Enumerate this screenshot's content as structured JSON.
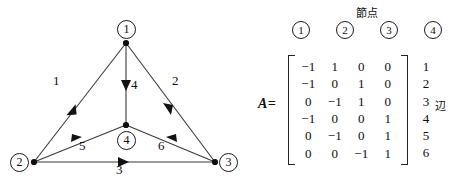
{
  "figure": {
    "graph": {
      "nodes": [
        {
          "id": "1",
          "label": "1",
          "badge_x": 117,
          "badge_y": 20,
          "dot_x": 126,
          "dot_y": 43
        },
        {
          "id": "2",
          "label": "2",
          "badge_x": 10,
          "badge_y": 153,
          "dot_x": 34,
          "dot_y": 162
        },
        {
          "id": "3",
          "label": "3",
          "badge_x": 219,
          "badge_y": 153,
          "dot_x": 215,
          "dot_y": 162
        },
        {
          "id": "4",
          "label": "4",
          "badge_x": 117,
          "badge_y": 131,
          "dot_x": 126,
          "dot_y": 125
        }
      ],
      "edges": [
        {
          "id": "1",
          "label": "1",
          "from": "1",
          "to": "2",
          "label_x": 58,
          "label_y": 80
        },
        {
          "id": "2",
          "label": "2",
          "from": "1",
          "to": "3",
          "label_x": 176,
          "label_y": 80
        },
        {
          "id": "3",
          "label": "3",
          "from": "2",
          "to": "3",
          "label_x": 119,
          "label_y": 166
        },
        {
          "id": "4",
          "label": "4",
          "from": "1",
          "to": "4",
          "label_x": 133,
          "label_y": 83
        },
        {
          "id": "5",
          "label": "5",
          "from": "2",
          "to": "4",
          "label_x": 82,
          "label_y": 143
        },
        {
          "id": "6",
          "label": "6",
          "from": "3",
          "to": "4",
          "label_x": 161,
          "label_y": 143
        }
      ]
    },
    "matrix": {
      "name_label": "A=",
      "column_group_label": "節点",
      "row_group_label": "辺",
      "column_headers": [
        "1",
        "2",
        "3",
        "4"
      ],
      "row_labels": [
        "1",
        "2",
        "3",
        "4",
        "5",
        "6"
      ],
      "rows": [
        [
          "−1",
          "1",
          "0",
          "0"
        ],
        [
          "−1",
          "0",
          "1",
          "0"
        ],
        [
          "0",
          "−1",
          "1",
          "0"
        ],
        [
          "−1",
          "0",
          "0",
          "1"
        ],
        [
          "0",
          "−1",
          "0",
          "1"
        ],
        [
          "0",
          "0",
          "−1",
          "1"
        ]
      ]
    },
    "colors": {
      "ink": "#0d0d0d",
      "line": "#3a3a3a",
      "background": "#ffffff"
    }
  }
}
